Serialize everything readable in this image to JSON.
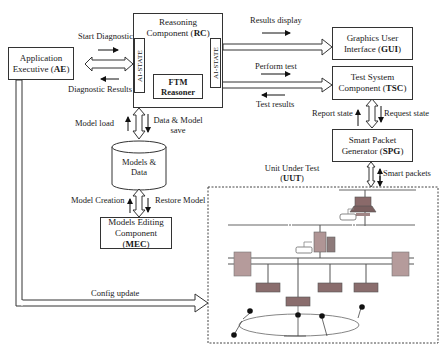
{
  "diagram": {
    "components": {
      "ae": {
        "line1": "Application",
        "line2_prefix": "Executive (",
        "abbr": "AE",
        "suffix": ")"
      },
      "rc": {
        "line1": "Reasoning",
        "line2_prefix": "Component (",
        "abbr": "RC",
        "suffix": ")"
      },
      "rc_left_state": "AI-STATE",
      "rc_right_state": "AI-STATE",
      "ftm": {
        "line1": "FTM",
        "line2": "Reasoner"
      },
      "gui": {
        "line1": "Graphics User",
        "line2_prefix": "Interface (",
        "abbr": "GUI",
        "suffix": ")"
      },
      "tsc": {
        "line1": "Test System",
        "line2_prefix": "Component (",
        "abbr": "TSC",
        "suffix": ")"
      },
      "spg": {
        "line1": "Smart Packet",
        "line2_prefix": "Generator (",
        "abbr": "SPG",
        "suffix": ")"
      },
      "models_data": {
        "line1": "Models &",
        "line2": "Data"
      },
      "mec": {
        "line1": "Models Editing",
        "line2_prefix": "Component (",
        "abbr": "MEC",
        "suffix": ")"
      },
      "uut": {
        "line1": "Unit Under Test",
        "line2_prefix": "(",
        "abbr": "UUT",
        "suffix": ")"
      }
    },
    "flows": {
      "start_diagnostic": "Start Diagnostic",
      "diagnostic_results": "Diagnostic Results",
      "results_display": "Results display",
      "perform_test": "Perform test",
      "test_results": "Test results",
      "report_state": "Report state",
      "request_state": "Request state",
      "smart_packets": "Smart packets",
      "model_load": "Model load",
      "data_model_save_1": "Data & Model",
      "data_model_save_2": "save",
      "model_creation": "Model Creation",
      "restore_model": "Restore Model",
      "config_update": "Config update"
    }
  }
}
